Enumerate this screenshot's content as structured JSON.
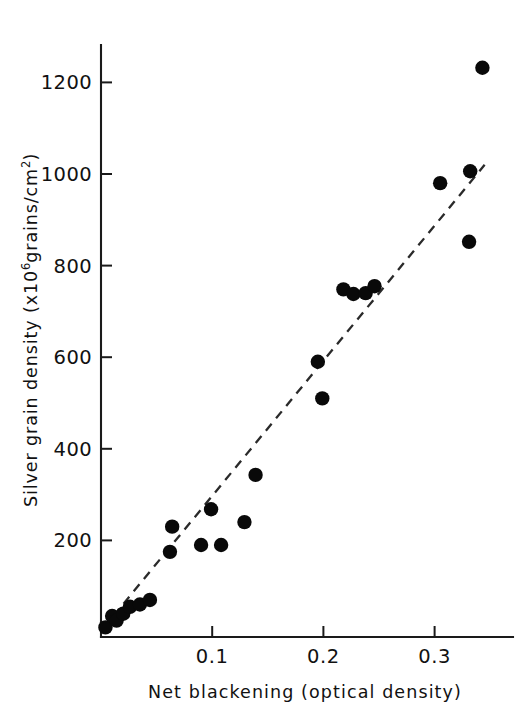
{
  "chart_data": {
    "type": "scatter",
    "title": "",
    "xlabel": "Net blackening (optical density)",
    "ylabel_text": "Silver grain density (x10",
    "ylabel_sup": "6",
    "ylabel_tail": "grains/cm",
    "ylabel_sup2": "2",
    "ylabel_close": ")",
    "ylabel_full": "Silver grain density (x10^6 grains/cm^2)",
    "xlim": [
      0,
      0.355
    ],
    "ylim": [
      0,
      1290
    ],
    "grid": false,
    "legend": "none",
    "xticks": [
      0.1,
      0.2,
      0.3
    ],
    "xtick_labels": [
      "0.1",
      "0.2",
      "0.3"
    ],
    "yticks": [
      200,
      400,
      600,
      800,
      1000,
      1200
    ],
    "ytick_labels": [
      "200",
      "400",
      "600",
      "800",
      "1000",
      "1200"
    ],
    "marker": "filled-circle",
    "marker_color": "#090909",
    "points": [
      {
        "x": 0.004,
        "y": 10
      },
      {
        "x": 0.01,
        "y": 35
      },
      {
        "x": 0.014,
        "y": 25
      },
      {
        "x": 0.02,
        "y": 40
      },
      {
        "x": 0.026,
        "y": 55
      },
      {
        "x": 0.035,
        "y": 60
      },
      {
        "x": 0.044,
        "y": 70
      },
      {
        "x": 0.062,
        "y": 175
      },
      {
        "x": 0.064,
        "y": 230
      },
      {
        "x": 0.09,
        "y": 190
      },
      {
        "x": 0.099,
        "y": 268
      },
      {
        "x": 0.108,
        "y": 190
      },
      {
        "x": 0.129,
        "y": 240
      },
      {
        "x": 0.139,
        "y": 343
      },
      {
        "x": 0.195,
        "y": 590
      },
      {
        "x": 0.199,
        "y": 510
      },
      {
        "x": 0.218,
        "y": 748
      },
      {
        "x": 0.227,
        "y": 738
      },
      {
        "x": 0.238,
        "y": 740
      },
      {
        "x": 0.246,
        "y": 755
      },
      {
        "x": 0.305,
        "y": 980
      },
      {
        "x": 0.331,
        "y": 852
      },
      {
        "x": 0.332,
        "y": 1006
      },
      {
        "x": 0.343,
        "y": 1232
      }
    ],
    "trend_line": {
      "style": "dashed",
      "color": "#2a2a2a",
      "x_start": 0.002,
      "y_start": 8,
      "x_end": 0.345,
      "y_end": 1020
    }
  }
}
